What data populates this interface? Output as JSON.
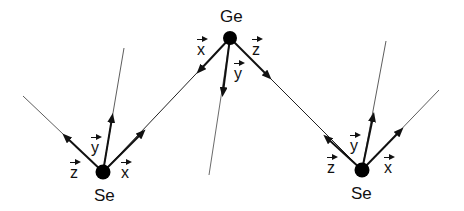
{
  "diagram": {
    "type": "molecular-geometry",
    "atoms": [
      {
        "id": "ge",
        "label": "Ge",
        "x": 230,
        "y": 38
      },
      {
        "id": "se_left",
        "label": "Se",
        "x": 103,
        "y": 172
      },
      {
        "id": "se_right",
        "label": "Se",
        "x": 362,
        "y": 170
      }
    ],
    "axis_labels": {
      "ge": {
        "x": "x",
        "y": "y",
        "z": "z"
      },
      "se_left": {
        "x": "x",
        "y": "y",
        "z": "z"
      },
      "se_right": {
        "x": "x",
        "y": "y",
        "z": "z"
      }
    },
    "colors": {
      "line": "#111111",
      "atom": "#000000"
    }
  }
}
